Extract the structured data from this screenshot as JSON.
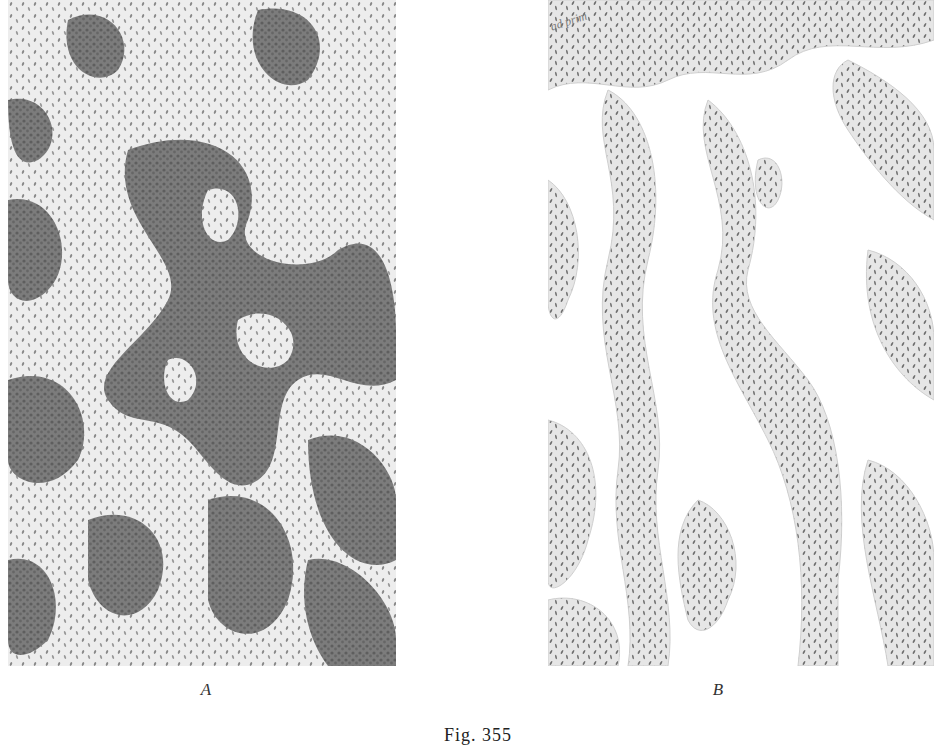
{
  "figure": {
    "caption": "Fig. 355",
    "panels": [
      {
        "label": "A",
        "description": "Histological drawing: dense darkly stained cellular strands forming anastomosing network around pale whorled islands of spindle cells",
        "tones": {
          "dark_tissue": "#7e7e7e",
          "pale_islands": "#ececec",
          "nuclei": "#5a5a5a"
        }
      },
      {
        "label": "B",
        "description": "Histological drawing: loose branching strands of spindle cells with elongated nuclei separated by clear spaces",
        "tones": {
          "stroma": "#eaeaea",
          "clear_space": "#ffffff",
          "nuclei": "#6a6a6a"
        }
      }
    ],
    "handwritten_note": "ad prim"
  }
}
